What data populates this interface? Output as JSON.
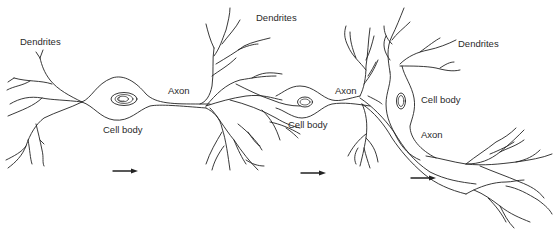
{
  "diagram": {
    "type": "neuron-chain-illustration",
    "neurons": [
      {
        "id": "neuron-1",
        "labels": {
          "dendrites": "Dendrites",
          "axon": "Axon",
          "cell_body": "Cell body"
        }
      },
      {
        "id": "neuron-2",
        "labels": {
          "dendrites": "Dendrites",
          "axon": "Axon",
          "cell_body": "Cell body"
        }
      },
      {
        "id": "neuron-3",
        "labels": {
          "dendrites": "Dendrites",
          "axon": "Axon",
          "cell_body": "Cell body"
        }
      }
    ],
    "signal_direction": "left-to-right",
    "arrow_count": 3,
    "stroke_color": "#222222",
    "background_color": "#ffffff"
  }
}
